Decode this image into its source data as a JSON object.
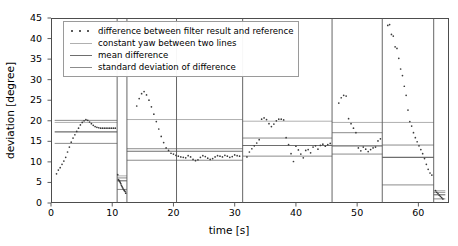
{
  "chart_data": {
    "type": "scatter",
    "title": "",
    "xlabel": "time [s]",
    "ylabel": "deviation [degree]",
    "xlim": [
      0,
      65
    ],
    "ylim": [
      0,
      45
    ],
    "xticks": [
      0,
      10,
      20,
      30,
      40,
      50,
      60
    ],
    "yticks": [
      0,
      5,
      10,
      15,
      20,
      25,
      30,
      35,
      40,
      45
    ],
    "grid": false,
    "legend_position": "upper left",
    "legend": [
      {
        "label": "difference between filter result and reference",
        "style": "dots",
        "color": "#3b3b3b"
      },
      {
        "label": "constant yaw between two lines",
        "style": "line",
        "color": "#b0b0b0"
      },
      {
        "label": "mean difference",
        "style": "line",
        "color": "#6e6e6e"
      },
      {
        "label": "standard deviation of difference",
        "style": "line",
        "color": "#8c8c8c"
      }
    ],
    "segment_divider_color": "#555555",
    "segment_dividers": [
      10.8,
      12.4,
      20.5,
      31.3,
      45.9,
      54.1,
      62.5
    ],
    "segments": [
      {
        "name": "segment-1",
        "t_start": 0.6,
        "t_end": 10.8,
        "constant_yaw": 19.6,
        "mean_difference": 17.3,
        "std_upper": 20.1,
        "std_lower": 14.5,
        "points_t": [
          0.9,
          1.2,
          1.5,
          1.8,
          2.1,
          2.4,
          2.7,
          3.0,
          3.3,
          3.6,
          3.9,
          4.2,
          4.5,
          4.8,
          5.1,
          5.4,
          5.7,
          6.0,
          6.3,
          6.6,
          6.9,
          7.2,
          7.5,
          7.8,
          8.1,
          8.4,
          8.7,
          9.0,
          9.3,
          9.6,
          9.9,
          10.2,
          10.5
        ],
        "points_y": [
          7.1,
          8.0,
          8.6,
          9.4,
          10.2,
          11.1,
          12.4,
          13.6,
          14.8,
          15.8,
          16.6,
          17.4,
          18.2,
          19.0,
          19.6,
          20.0,
          20.3,
          20.1,
          19.7,
          19.3,
          18.9,
          18.6,
          18.4,
          18.3,
          18.2,
          18.2,
          18.2,
          18.2,
          18.2,
          18.2,
          18.2,
          18.2,
          18.2
        ]
      },
      {
        "name": "segment-2",
        "t_start": 10.8,
        "t_end": 12.4,
        "constant_yaw": 6.6,
        "mean_difference": 5.4,
        "std_upper": 6.1,
        "std_lower": 3.3,
        "points_t": [
          10.9,
          11.0,
          11.1,
          11.2,
          11.3,
          11.4,
          11.5,
          11.6,
          11.7,
          11.8,
          11.9,
          12.0,
          12.1,
          12.2
        ],
        "points_y": [
          6.9,
          5.7,
          5.5,
          5.3,
          5.0,
          4.7,
          4.3,
          4.0,
          3.7,
          3.4,
          3.2,
          3.0,
          2.8,
          2.4
        ]
      },
      {
        "name": "segment-3",
        "t_start": 12.4,
        "t_end": 31.3,
        "constant_yaw": 20.3,
        "mean_difference": 12.6,
        "std_upper": 13.2,
        "std_lower": 10.4,
        "points_t": [
          14.0,
          14.4,
          14.8,
          15.2,
          15.6,
          16.0,
          16.4,
          16.8,
          17.2,
          17.6,
          18.0,
          18.4,
          18.8,
          19.2,
          19.6,
          20.0,
          20.4,
          20.8,
          21.2,
          21.6,
          22.0,
          22.4,
          22.8,
          23.2,
          23.6,
          24.0,
          24.4,
          24.8,
          25.2,
          25.6,
          26.0,
          26.4,
          26.8,
          27.2,
          27.6,
          28.0,
          28.4,
          28.8,
          29.2,
          29.6,
          30.0,
          30.4,
          30.8
        ],
        "points_y": [
          23.6,
          25.4,
          26.6,
          27.1,
          26.3,
          25.0,
          23.4,
          21.6,
          19.8,
          18.0,
          16.2,
          14.7,
          13.4,
          12.8,
          12.1,
          11.9,
          11.6,
          11.4,
          11.2,
          11.1,
          11.0,
          11.5,
          11.2,
          10.6,
          10.3,
          10.5,
          11.1,
          11.5,
          11.3,
          10.9,
          10.6,
          10.8,
          11.2,
          11.5,
          11.4,
          11.2,
          11.6,
          11.4,
          11.1,
          11.3,
          11.7,
          11.5,
          11.4
        ]
      },
      {
        "name": "segment-4",
        "t_start": 31.3,
        "t_end": 45.9,
        "constant_yaw": 19.9,
        "mean_difference": 14.0,
        "std_upper": 15.8,
        "std_lower": 11.4,
        "points_t": [
          32.0,
          32.4,
          32.8,
          33.2,
          33.6,
          34.0,
          34.4,
          34.8,
          35.2,
          35.6,
          36.0,
          36.4,
          36.8,
          37.2,
          37.6,
          38.0,
          38.4,
          38.8,
          39.2,
          39.6,
          40.0,
          40.4,
          40.8,
          41.2,
          41.6,
          42.0,
          42.4,
          42.8,
          43.2,
          43.6,
          44.0,
          44.4,
          44.8,
          45.2,
          45.6
        ],
        "points_y": [
          11.2,
          12.4,
          13.2,
          13.9,
          14.6,
          15.4,
          20.4,
          20.7,
          20.3,
          19.3,
          18.6,
          19.2,
          20.0,
          20.4,
          20.4,
          20.2,
          15.9,
          14.2,
          12.0,
          10.1,
          13.8,
          12.9,
          11.9,
          11.0,
          12.8,
          13.0,
          12.2,
          13.6,
          13.9,
          13.1,
          14.0,
          14.3,
          13.8,
          14.2,
          14.5
        ]
      },
      {
        "name": "segment-5",
        "t_start": 45.9,
        "t_end": 54.1,
        "constant_yaw": 19.6,
        "mean_difference": 13.9,
        "std_upper": 17.1,
        "std_lower": 11.9,
        "points_t": [
          47.0,
          47.4,
          47.8,
          48.2,
          48.6,
          49.0,
          49.4,
          49.8,
          50.2,
          50.6,
          51.0,
          51.4,
          51.8,
          52.2,
          52.6,
          53.0,
          53.4,
          53.8
        ],
        "points_y": [
          24.3,
          25.6,
          26.2,
          26.0,
          20.5,
          19.3,
          18.2,
          17.1,
          13.4,
          12.7,
          13.6,
          13.1,
          12.5,
          13.0,
          13.4,
          13.6,
          15.1,
          15.6
        ]
      },
      {
        "name": "segment-6",
        "t_start": 54.1,
        "t_end": 62.5,
        "constant_yaw": 19.6,
        "mean_difference": 11.1,
        "std_upper": 14.1,
        "std_lower": 4.4,
        "points_t": [
          55.0,
          55.3,
          55.6,
          55.9,
          56.2,
          56.5,
          56.8,
          57.1,
          57.4,
          57.7,
          58.0,
          58.3,
          58.6,
          58.9,
          59.2,
          59.5,
          59.8,
          60.1,
          60.4,
          60.7,
          61.0,
          61.3,
          61.6,
          61.9,
          62.2
        ],
        "points_y": [
          43.2,
          43.4,
          41.0,
          40.6,
          38.0,
          37.6,
          35.2,
          32.6,
          31.0,
          28.4,
          26.2,
          22.6,
          19.8,
          18.7,
          17.1,
          15.9,
          14.9,
          13.9,
          13.0,
          12.0,
          10.8,
          9.4,
          8.2,
          7.3,
          6.8
        ]
      },
      {
        "name": "segment-7",
        "t_start": 62.5,
        "t_end": 64.4,
        "constant_yaw": 3.0,
        "mean_difference": 2.0,
        "std_upper": 2.6,
        "std_lower": 1.0,
        "points_t": [
          62.8,
          63.0,
          63.2,
          63.4,
          63.6,
          63.8,
          64.0
        ],
        "points_y": [
          3.0,
          2.6,
          2.3,
          1.9,
          1.6,
          1.3,
          1.0
        ]
      }
    ]
  }
}
